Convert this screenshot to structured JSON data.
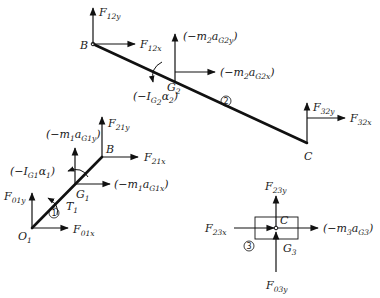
{
  "diagram": {
    "type": "free-body-diagram",
    "link2": {
      "id": "2",
      "points": {
        "B": "B",
        "G2": "G",
        "G2_sub": "2",
        "C": "C"
      },
      "forces": {
        "F12y": {
          "main": "F",
          "sub": "12y"
        },
        "F12x": {
          "main": "F",
          "sub": "12x"
        },
        "inertia_y": {
          "pre": "(−m",
          "sub1": "2",
          "mid": "a",
          "sub2": "G2y",
          "post": ")"
        },
        "inertia_x": {
          "pre": "(−m",
          "sub1": "2",
          "mid": "a",
          "sub2": "G2x",
          "post": ")"
        },
        "inertia_moment": {
          "pre": "(−I",
          "sub1": "G",
          "sub1b": "2",
          "mid": "α",
          "sub2": "2",
          "post": ")"
        },
        "F32y": {
          "main": "F",
          "sub": "32y"
        },
        "F32x": {
          "main": "F",
          "sub": "32x"
        }
      }
    },
    "link1": {
      "id": "1",
      "points": {
        "O1": "O",
        "O1_sub": "1",
        "B": "B",
        "G1": "G",
        "G1_sub": "1"
      },
      "forces": {
        "F21y": {
          "main": "F",
          "sub": "21y"
        },
        "F21x": {
          "main": "F",
          "sub": "21x"
        },
        "inertia_y": {
          "pre": "(−m",
          "sub1": "1",
          "mid": "a",
          "sub2": "G1y",
          "post": ")"
        },
        "inertia_x": {
          "pre": "(−m",
          "sub1": "1",
          "mid": "a",
          "sub2": "G1x",
          "post": ")"
        },
        "inertia_moment": {
          "pre": "(−I",
          "sub1": "G1",
          "mid": "α",
          "sub2": "1",
          "post": ")"
        },
        "F01y": {
          "main": "F",
          "sub": "01y"
        },
        "F01x": {
          "main": "F",
          "sub": "01x"
        },
        "torque": {
          "main": "T",
          "sub": "1"
        }
      }
    },
    "link3": {
      "id": "3",
      "points": {
        "C": "C",
        "G3": "G",
        "G3_sub": "3"
      },
      "forces": {
        "F23y": {
          "main": "F",
          "sub": "23y"
        },
        "F23x": {
          "main": "F",
          "sub": "23x"
        },
        "inertia_x": {
          "pre": "(−m",
          "sub1": "3",
          "mid": "a",
          "sub2": "G3",
          "post": ")"
        },
        "F03y": {
          "main": "F",
          "sub": "03y"
        }
      }
    }
  }
}
